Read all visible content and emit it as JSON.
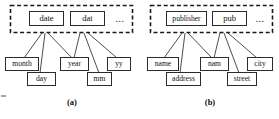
{
  "figure": {
    "panels": [
      {
        "id": "a",
        "caption": "(a)",
        "group": {
          "ellipsis": "..."
        },
        "parents": [
          {
            "label": "date"
          },
          {
            "label": "dat"
          }
        ],
        "children": [
          {
            "label": "month"
          },
          {
            "label": "day"
          },
          {
            "label": "year"
          },
          {
            "label": "mm"
          },
          {
            "label": "yy"
          }
        ]
      },
      {
        "id": "b",
        "caption": "(b)",
        "group": {
          "ellipsis": "..."
        },
        "parents": [
          {
            "label": "publisher"
          },
          {
            "label": "pub"
          }
        ],
        "children": [
          {
            "label": "name"
          },
          {
            "label": "address"
          },
          {
            "label": "nam"
          },
          {
            "label": "street"
          },
          {
            "label": "city"
          }
        ]
      }
    ]
  }
}
